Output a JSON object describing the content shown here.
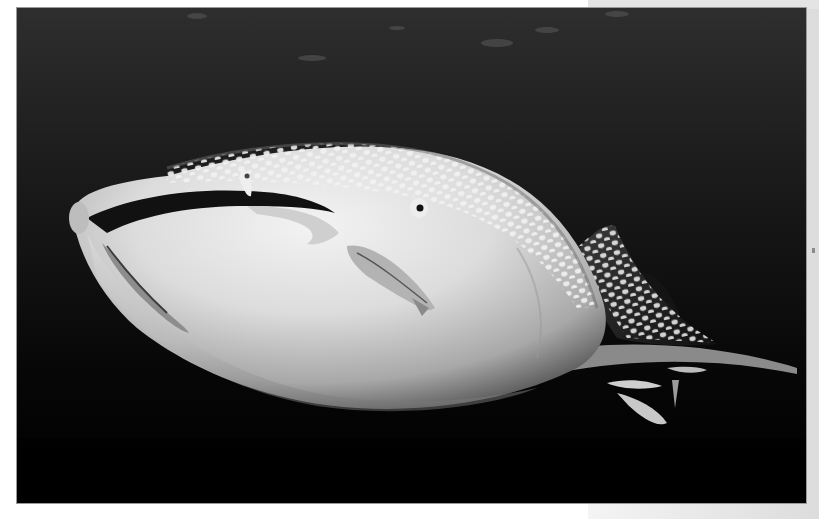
{
  "image": {
    "subject": "whale shark swimming underwater with remora fish",
    "style": "grayscale photograph",
    "colors": {
      "water_top": "#2b2b2b",
      "water_bottom": "#000000",
      "shark_body": "#d8d8d8",
      "shark_highlight": "#f2f2f2",
      "spots": "#f0f0f0",
      "page_margin": "#e6e6e6"
    }
  }
}
